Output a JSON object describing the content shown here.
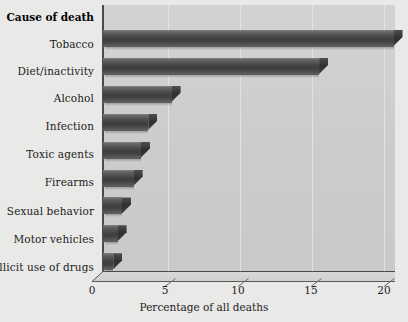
{
  "chart_data": {
    "type": "bar",
    "orientation": "horizontal",
    "title": "",
    "xlabel": "Percentage of all deaths",
    "ylabel": "Cause of death",
    "xlim": [
      0,
      20
    ],
    "xticks": [
      0,
      5,
      10,
      15,
      20
    ],
    "xtick_labels": [
      "0",
      "5",
      "10",
      "15",
      "20"
    ],
    "grid": true,
    "grid_axis": "x",
    "legend": false,
    "categories": [
      "Tobacco",
      "Diet/inactivity",
      "Alcohol",
      "Infection",
      "Toxic agents",
      "Firearms",
      "Sexual behavior",
      "Motor vehicles",
      "Illicit use of drugs"
    ],
    "values": [
      19.9,
      14.8,
      4.7,
      3.1,
      2.6,
      2.1,
      1.3,
      1.0,
      0.7
    ],
    "bar_color": "#474747",
    "panel_color": "#cfcfcd",
    "background_color": "#e9e9e7"
  },
  "axes": {
    "y_axis_title": "Cause of death",
    "x_axis_title": "Percentage of all deaths"
  }
}
